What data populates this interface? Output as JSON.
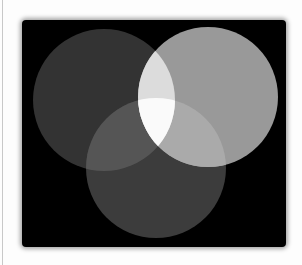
{
  "figure": {
    "background_color": "#000000",
    "page_color": "#fdfdfd",
    "circles": [
      {
        "name": "left",
        "cx": 104,
        "cy": 100,
        "r": 71,
        "color": "#333333"
      },
      {
        "name": "right",
        "cx": 208,
        "cy": 97,
        "r": 70,
        "color": "#999999"
      },
      {
        "name": "bottom",
        "cx": 156,
        "cy": 168,
        "r": 70,
        "color": "#3c3c3c"
      }
    ],
    "overlaps": {
      "left_bottom": "#555555",
      "right_bottom": "#aaaaaa",
      "left_right": "#dcdcdc",
      "all_three": "#fafafa"
    }
  }
}
